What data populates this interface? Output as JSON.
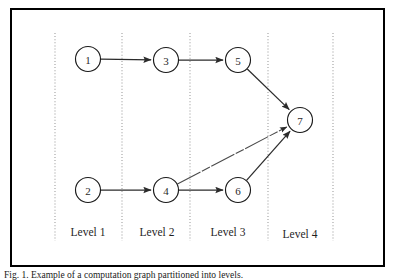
{
  "figure": {
    "caption": "Fig. 1. Example of a computation graph partitioned into levels.",
    "frame": {
      "x": 10,
      "y": 8,
      "width": 375,
      "height": 259,
      "border_color": "#000000"
    },
    "canvas": {
      "width": 395,
      "height": 280,
      "background": "#ffffff"
    }
  },
  "chart_data": {
    "type": "diagram",
    "node_radius": 12.5,
    "nodes": [
      {
        "id": "1",
        "label": "1",
        "x": 88,
        "y": 59,
        "level": 1
      },
      {
        "id": "2",
        "label": "2",
        "x": 88,
        "y": 190,
        "level": 1
      },
      {
        "id": "3",
        "label": "3",
        "x": 166,
        "y": 60,
        "level": 2
      },
      {
        "id": "4",
        "label": "4",
        "x": 166,
        "y": 190,
        "level": 2
      },
      {
        "id": "5",
        "label": "5",
        "x": 238,
        "y": 60,
        "level": 3
      },
      {
        "id": "6",
        "label": "6",
        "x": 238,
        "y": 190,
        "level": 3
      },
      {
        "id": "7",
        "label": "7",
        "x": 300,
        "y": 120,
        "level": 4
      }
    ],
    "edges": [
      {
        "from": "1",
        "to": "3",
        "style": "solid"
      },
      {
        "from": "3",
        "to": "5",
        "style": "solid"
      },
      {
        "from": "5",
        "to": "7",
        "style": "solid"
      },
      {
        "from": "2",
        "to": "4",
        "style": "solid"
      },
      {
        "from": "4",
        "to": "6",
        "style": "solid"
      },
      {
        "from": "4",
        "to": "7",
        "style": "faint-dashed"
      },
      {
        "from": "6",
        "to": "7",
        "style": "solid"
      }
    ],
    "dividers": [
      {
        "x": 55,
        "y1": 33,
        "y2": 241
      },
      {
        "x": 122,
        "y1": 33,
        "y2": 241
      },
      {
        "x": 190,
        "y1": 33,
        "y2": 241
      },
      {
        "x": 268,
        "y1": 33,
        "y2": 241
      },
      {
        "x": 333,
        "y1": 33,
        "y2": 241
      }
    ],
    "level_labels": [
      {
        "text": "Level 1",
        "x": 88,
        "y": 236
      },
      {
        "text": "Level 2",
        "x": 157,
        "y": 236
      },
      {
        "text": "Level 3",
        "x": 228,
        "y": 236
      },
      {
        "text": "Level 4",
        "x": 300,
        "y": 238
      }
    ],
    "colors": {
      "node_fill": "#ffffff",
      "node_stroke": "#1a1a1a",
      "edge": "#2b2b2b",
      "divider": "#9a9a9a",
      "text": "#1f1f1f",
      "frame": "#000000"
    }
  }
}
